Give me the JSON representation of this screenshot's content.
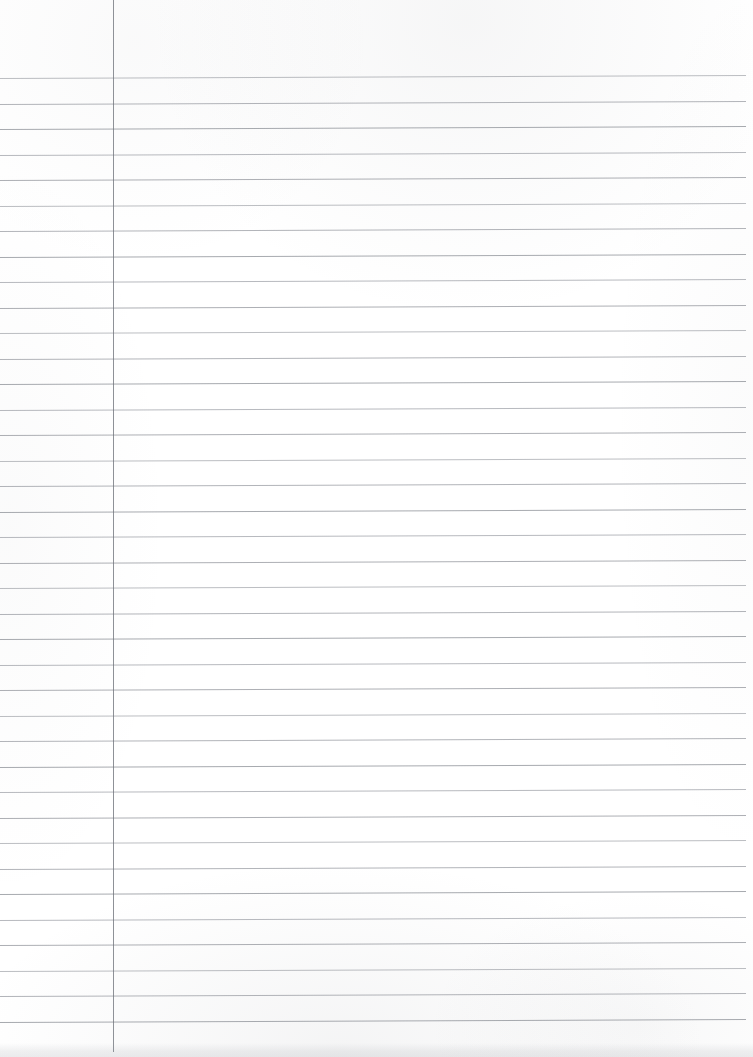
{
  "document": {
    "kind": "scanned-ruled-notebook-paper",
    "title": "Blank Lined Paper Scan",
    "page_width": 753,
    "page_height": 1057,
    "background_color": "#ffffff",
    "content_text": "",
    "is_blank": true
  },
  "ruling": {
    "line_color": "#7a7e86",
    "line_count": 38,
    "first_line_y": 78,
    "line_spacing": 25.5,
    "line_left_x": 0,
    "line_right_x": 746,
    "slope_px": -3,
    "header_space_height": 78
  },
  "margin": {
    "name": "vertical-margin-rule",
    "color": "#6e727a",
    "x": 113,
    "top_y": 0,
    "bottom_y": 1052,
    "width": 1
  },
  "scan_artifacts": {
    "bottom_shadow_color": "#8c8f96",
    "texture_opacity": "0.08"
  }
}
